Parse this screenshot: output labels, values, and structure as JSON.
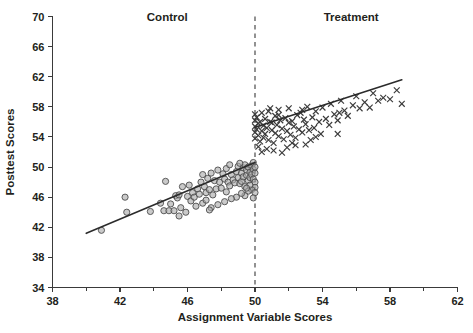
{
  "chart_data": {
    "type": "scatter",
    "title": "",
    "xlabel": "Assignment Variable Scores",
    "ylabel": "Posttest Scores",
    "xlim": [
      38,
      62
    ],
    "ylim": [
      34,
      70
    ],
    "xticks": [
      38,
      42,
      46,
      50,
      54,
      58,
      62
    ],
    "xticklabels": [
      "38",
      "42",
      "46",
      "50",
      "54",
      "58",
      "62"
    ],
    "xminorticks": [
      40,
      44,
      48,
      52,
      56,
      60
    ],
    "yticks": [
      34,
      38,
      42,
      46,
      50,
      54,
      58,
      62,
      66,
      70
    ],
    "yticklabels": [
      "34",
      "38",
      "42",
      "46",
      "50",
      "54",
      "58",
      "62",
      "66",
      "70"
    ],
    "grid": false,
    "legend_position": "none",
    "annotations": [
      {
        "name": "control-label",
        "text": "Control",
        "x": 44.8,
        "y": 69.4
      },
      {
        "name": "treatment-label",
        "text": "Treatment",
        "x": 55.7,
        "y": 69.4
      }
    ],
    "cutoff": {
      "name": "cutoff-line",
      "x": 50,
      "style": "dashed"
    },
    "series": [
      {
        "name": "Control",
        "marker": "circle",
        "color": "#a9a9a9",
        "edge_color": "#4d4d4d",
        "fit": {
          "x": [
            40.0,
            50.0
          ],
          "y": [
            41.2,
            50.6
          ]
        },
        "points": [
          [
            40.9,
            41.6
          ],
          [
            42.3,
            46.0
          ],
          [
            42.4,
            44.0
          ],
          [
            43.8,
            44.1
          ],
          [
            44.4,
            45.2
          ],
          [
            44.6,
            44.2
          ],
          [
            44.7,
            48.1
          ],
          [
            44.9,
            44.2
          ],
          [
            45.0,
            45.1
          ],
          [
            45.2,
            44.2
          ],
          [
            45.3,
            46.2
          ],
          [
            45.4,
            45.9
          ],
          [
            45.5,
            43.5
          ],
          [
            45.5,
            46.3
          ],
          [
            45.6,
            44.6
          ],
          [
            45.7,
            47.4
          ],
          [
            45.9,
            44.0
          ],
          [
            46.0,
            46.1
          ],
          [
            46.1,
            47.6
          ],
          [
            46.2,
            45.5
          ],
          [
            46.3,
            46.6
          ],
          [
            46.4,
            46.0
          ],
          [
            46.5,
            44.8
          ],
          [
            46.6,
            47.1
          ],
          [
            46.7,
            46.4
          ],
          [
            46.8,
            48.0
          ],
          [
            46.9,
            45.2
          ],
          [
            47.0,
            47.4
          ],
          [
            47.1,
            46.6
          ],
          [
            47.2,
            48.5
          ],
          [
            47.3,
            47.0
          ],
          [
            47.4,
            49.2
          ],
          [
            47.5,
            46.3
          ],
          [
            47.6,
            48.2
          ],
          [
            47.7,
            47.1
          ],
          [
            47.8,
            49.6
          ],
          [
            47.9,
            48.0
          ],
          [
            48.0,
            47.2
          ],
          [
            48.1,
            49.1
          ],
          [
            48.2,
            48.4
          ],
          [
            48.3,
            46.7
          ],
          [
            48.3,
            49.8
          ],
          [
            48.4,
            48.0
          ],
          [
            48.5,
            47.5
          ],
          [
            48.6,
            49.0
          ],
          [
            48.7,
            48.3
          ],
          [
            48.8,
            47.9
          ],
          [
            48.9,
            49.4
          ],
          [
            49.0,
            48.6
          ],
          [
            49.0,
            50.1
          ],
          [
            49.1,
            47.8
          ],
          [
            49.2,
            49.2
          ],
          [
            49.2,
            48.1
          ],
          [
            49.3,
            49.9
          ],
          [
            49.3,
            48.7
          ],
          [
            49.4,
            47.4
          ],
          [
            49.4,
            50.3
          ],
          [
            49.5,
            48.9
          ],
          [
            49.5,
            49.6
          ],
          [
            49.6,
            48.2
          ],
          [
            49.6,
            50.0
          ],
          [
            49.7,
            49.3
          ],
          [
            49.7,
            48.6
          ],
          [
            49.8,
            50.2
          ],
          [
            49.8,
            49.0
          ],
          [
            49.9,
            48.4
          ],
          [
            49.9,
            49.7
          ],
          [
            49.9,
            50.6
          ],
          [
            50.0,
            49.2
          ],
          [
            50.0,
            48.0
          ],
          [
            50.0,
            50.0
          ],
          [
            50.0,
            47.3
          ],
          [
            49.8,
            47.0
          ],
          [
            49.6,
            46.8
          ],
          [
            49.4,
            46.2
          ],
          [
            49.2,
            46.5
          ],
          [
            48.9,
            46.0
          ],
          [
            48.6,
            45.8
          ],
          [
            48.2,
            45.4
          ],
          [
            47.8,
            45.0
          ],
          [
            47.4,
            44.6
          ],
          [
            47.1,
            45.6
          ],
          [
            46.9,
            49.0
          ],
          [
            47.3,
            44.3
          ],
          [
            48.5,
            50.3
          ],
          [
            49.1,
            50.5
          ],
          [
            49.7,
            47.6
          ],
          [
            50.0,
            46.6
          ],
          [
            49.9,
            45.9
          ],
          [
            49.5,
            47.2
          ]
        ]
      },
      {
        "name": "Treatment",
        "marker": "x",
        "color": "#3b3b3b",
        "fit": {
          "x": [
            50.0,
            58.7
          ],
          "y": [
            55.3,
            61.6
          ]
        },
        "points": [
          [
            50.0,
            56.2
          ],
          [
            50.0,
            55.4
          ],
          [
            50.0,
            54.6
          ],
          [
            50.0,
            53.8
          ],
          [
            50.0,
            57.0
          ],
          [
            50.1,
            55.0
          ],
          [
            50.1,
            56.6
          ],
          [
            50.2,
            54.2
          ],
          [
            50.2,
            55.8
          ],
          [
            50.3,
            53.4
          ],
          [
            50.3,
            56.0
          ],
          [
            50.4,
            54.8
          ],
          [
            50.4,
            57.2
          ],
          [
            50.5,
            55.5
          ],
          [
            50.5,
            53.9
          ],
          [
            50.6,
            56.4
          ],
          [
            50.6,
            54.4
          ],
          [
            50.7,
            55.2
          ],
          [
            50.8,
            57.4
          ],
          [
            50.8,
            53.6
          ],
          [
            50.9,
            56.0
          ],
          [
            51.0,
            54.9
          ],
          [
            51.0,
            55.9
          ],
          [
            51.1,
            53.2
          ],
          [
            51.2,
            56.8
          ],
          [
            51.2,
            54.5
          ],
          [
            51.3,
            55.6
          ],
          [
            51.4,
            57.6
          ],
          [
            51.4,
            54.1
          ],
          [
            51.5,
            56.2
          ],
          [
            51.6,
            55.1
          ],
          [
            51.7,
            53.7
          ],
          [
            51.8,
            56.5
          ],
          [
            51.9,
            54.8
          ],
          [
            52.0,
            55.9
          ],
          [
            52.0,
            57.8
          ],
          [
            52.1,
            54.3
          ],
          [
            52.2,
            56.1
          ],
          [
            52.3,
            55.4
          ],
          [
            52.4,
            53.9
          ],
          [
            52.5,
            56.9
          ],
          [
            52.6,
            55.0
          ],
          [
            52.7,
            57.2
          ],
          [
            52.8,
            54.6
          ],
          [
            52.9,
            56.3
          ],
          [
            53.0,
            55.7
          ],
          [
            53.1,
            58.0
          ],
          [
            53.2,
            54.9
          ],
          [
            53.4,
            56.6
          ],
          [
            53.5,
            55.2
          ],
          [
            53.6,
            57.4
          ],
          [
            53.8,
            56.0
          ],
          [
            53.9,
            54.4
          ],
          [
            54.0,
            57.9
          ],
          [
            54.2,
            56.4
          ],
          [
            54.4,
            55.6
          ],
          [
            54.5,
            58.4
          ],
          [
            54.7,
            57.0
          ],
          [
            54.9,
            56.2
          ],
          [
            55.1,
            58.8
          ],
          [
            55.3,
            57.5
          ],
          [
            55.5,
            56.8
          ],
          [
            55.8,
            58.2
          ],
          [
            56.0,
            59.4
          ],
          [
            56.2,
            57.8
          ],
          [
            56.5,
            58.6
          ],
          [
            56.8,
            57.9
          ],
          [
            57.0,
            59.8
          ],
          [
            57.3,
            58.8
          ],
          [
            57.6,
            59.2
          ],
          [
            58.0,
            59.0
          ],
          [
            58.4,
            60.2
          ],
          [
            58.7,
            58.4
          ],
          [
            50.7,
            52.4
          ],
          [
            51.1,
            52.2
          ],
          [
            51.9,
            52.6
          ],
          [
            52.4,
            52.9
          ],
          [
            53.0,
            53.0
          ],
          [
            51.6,
            51.9
          ],
          [
            50.4,
            52.0
          ],
          [
            53.6,
            54.0
          ],
          [
            54.9,
            54.4
          ],
          [
            52.2,
            53.2
          ],
          [
            50.2,
            52.7
          ],
          [
            51.4,
            56.9
          ],
          [
            52.8,
            57.6
          ],
          [
            53.3,
            53.6
          ],
          [
            50.9,
            57.8
          ],
          [
            55.0,
            57.2
          ]
        ]
      }
    ]
  }
}
